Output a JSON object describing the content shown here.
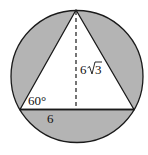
{
  "diagram": {
    "colors": {
      "shade": "#b4b4b4",
      "stroke": "#1a1a1a",
      "triangle_fill": "#ffffff"
    },
    "labels": {
      "angle": "60°",
      "base_half": "6",
      "height_coef": "6",
      "height_radicand": "3"
    }
  }
}
